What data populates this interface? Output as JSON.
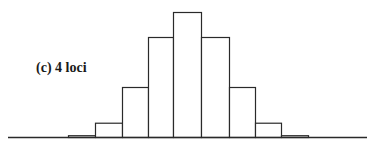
{
  "chart_data": {
    "type": "bar",
    "title": "(c) 4 loci",
    "xlabel": "",
    "ylabel": "",
    "categories": [
      "0",
      "1",
      "2",
      "3",
      "4",
      "5",
      "6",
      "7",
      "8"
    ],
    "values": [
      1,
      8,
      28,
      56,
      70,
      56,
      28,
      8,
      1
    ],
    "ylim": [
      0,
      70
    ],
    "grid": false,
    "legend": null,
    "layout": {
      "baseline_y": 137,
      "axis_x_start": 8,
      "axis_x_end": 367,
      "bar_left_edges": [
        68,
        95,
        122,
        148,
        173,
        201,
        229,
        255,
        281
      ],
      "bar_right_edge": 308,
      "max_bar_height_px": 125
    }
  },
  "panel": {
    "label": "(c) 4 loci"
  }
}
